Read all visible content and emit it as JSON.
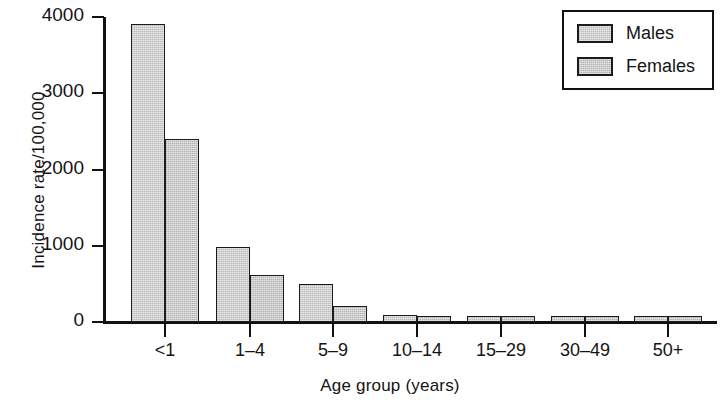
{
  "chart_data": {
    "type": "bar",
    "title": "",
    "xlabel": "Age group (years)",
    "ylabel": "Incidence rate/100,000",
    "categories": [
      "<1",
      "1–4",
      "5–9",
      "10–14",
      "15–29",
      "30–49",
      "50+"
    ],
    "series": [
      {
        "name": "Males",
        "values": [
          3910,
          980,
          500,
          90,
          75,
          75,
          75
        ]
      },
      {
        "name": "Females",
        "values": [
          2400,
          615,
          210,
          85,
          75,
          75,
          75
        ]
      }
    ],
    "ylim": [
      0,
      4000
    ],
    "yticks": [
      0,
      1000,
      2000,
      3000,
      4000
    ],
    "ytick_labels": [
      "0",
      "1000",
      "2000",
      "3000",
      "4000"
    ],
    "grid": false,
    "legend_position": "top-right",
    "legend_entries": [
      "Males",
      "Females"
    ],
    "bar_fill_male": "#c6c6c6",
    "bar_fill_female": "#bebebe",
    "bar_edge_color": "#1b1b1b",
    "axis_color": "#111111"
  }
}
